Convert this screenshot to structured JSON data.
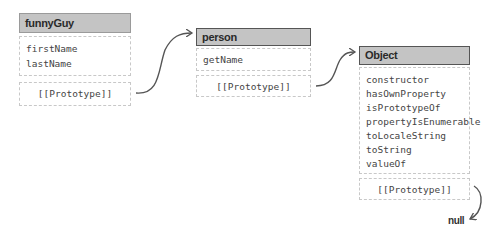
{
  "objects": {
    "funnyGuy": {
      "title": "funnyGuy",
      "properties": [
        "firstName",
        "lastName"
      ],
      "prototype_label": "[[Prototype]]"
    },
    "person": {
      "title": "person",
      "properties": [
        "getName"
      ],
      "prototype_label": "[[Prototype]]"
    },
    "object": {
      "title": "Object",
      "properties": [
        "constructor",
        "hasOwnProperty",
        "isPrototypeOf",
        "propertyIsEnumerable",
        "toLocaleString",
        "toString",
        "valueOf"
      ],
      "prototype_label": "[[Prototype]]"
    }
  },
  "terminal": {
    "label": "null"
  },
  "colors": {
    "header_fill": "#c4c4c4",
    "arrow": "#555555",
    "dashed_border": "#c8c8c8"
  }
}
